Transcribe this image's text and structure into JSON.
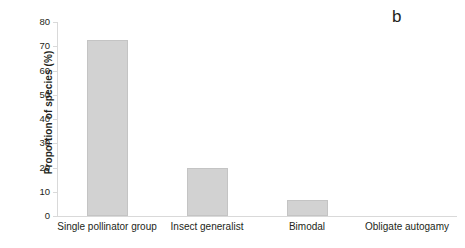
{
  "figure": {
    "panel_label": "b",
    "accent_color": "#d2d2d2",
    "axis_color": "#d9d9d9",
    "text_color": "#231f20"
  },
  "chart_data": {
    "type": "bar",
    "title": "",
    "subtitle": "",
    "panel": "b",
    "xlabel": "",
    "ylabel": "Proportion of species (%)",
    "categories": [
      "Single pollinator group",
      "Insect generalist",
      "Bimodal",
      "Obligate autogamy"
    ],
    "values": [
      72.5,
      19.7,
      6.6,
      0
    ],
    "ylim": [
      0,
      80
    ],
    "yticks": [
      0,
      10,
      20,
      30,
      40,
      50,
      60,
      70,
      80
    ],
    "ytick_labels": [
      "0",
      "10",
      "20",
      "30",
      "40",
      "50",
      "60",
      "70",
      "80"
    ],
    "grid": false,
    "legend": null,
    "legend_position": "none",
    "bar_color": "#d2d2d2",
    "bar_edge_color": "#c4c4c4",
    "annotations": [
      "b"
    ]
  }
}
